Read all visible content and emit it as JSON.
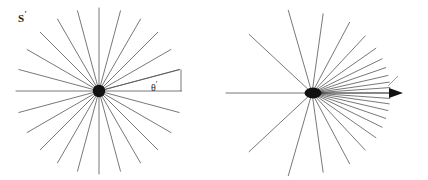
{
  "figure": {
    "caption_present": false,
    "background_color": "#ffffff",
    "ray_color": "#555555",
    "accent_color": "#111111"
  },
  "panels": [
    {
      "id": "panel-primed",
      "frame_label": "S",
      "frame_label_prime": "′",
      "angle_label": "θ",
      "angle_label_prime": "′",
      "description": "isotropic emission",
      "center": {
        "x": 99,
        "y": 91
      },
      "ray_count": 24,
      "ray_step_degrees": 15,
      "ray_length": 83
    },
    {
      "id": "panel-lab",
      "frame_label": "S",
      "frame_label_prime": "",
      "angle_label": "θ",
      "angle_label_prime": "",
      "velocity_label": "v",
      "description": "relativistically beamed emission",
      "center": {
        "x": 312,
        "y": 93
      },
      "ray_count": 24,
      "beta": 0.93
    }
  ],
  "chart_data": {
    "type": "scatter",
    "title": "",
    "xlabel": "",
    "ylabel": "",
    "series": [
      {
        "name": "S-prime isotropic rays (emission angles, degrees)",
        "values": [
          0,
          15,
          30,
          45,
          60,
          75,
          90,
          105,
          120,
          135,
          150,
          165,
          180,
          195,
          210,
          225,
          240,
          255,
          270,
          285,
          300,
          315,
          330,
          345
        ]
      },
      {
        "name": "S aberrated rays (observed angles, degrees)",
        "values": [
          0,
          4,
          8,
          13,
          19,
          26,
          35,
          47,
          62,
          82,
          106,
          137,
          180,
          223,
          254,
          278,
          298,
          313,
          325,
          334,
          341,
          347,
          352,
          356
        ]
      }
    ],
    "annotations": [
      "S′",
      "θ′",
      "S",
      "θ",
      "v"
    ]
  }
}
